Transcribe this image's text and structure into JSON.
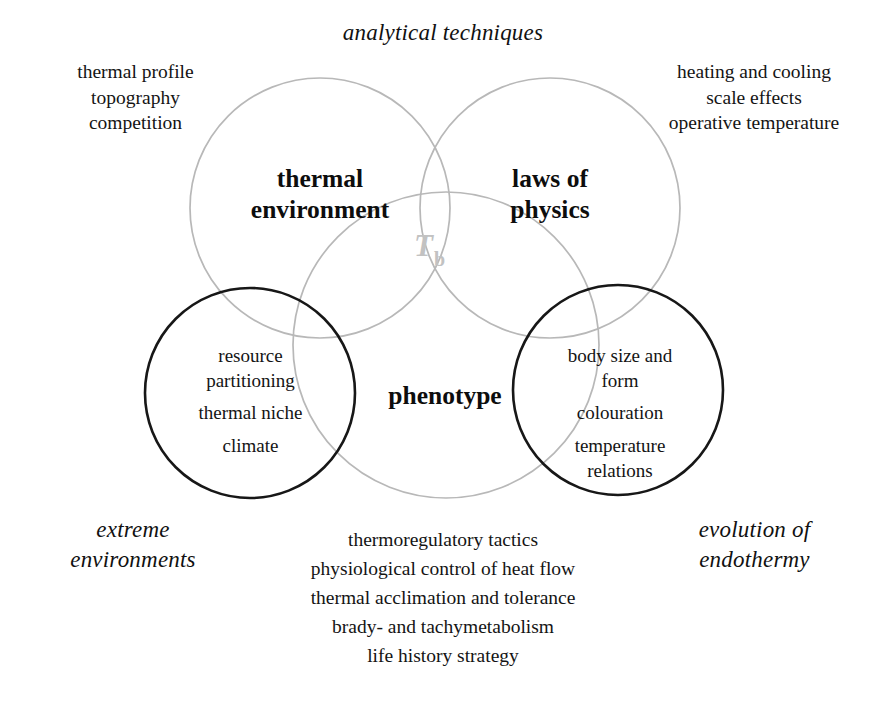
{
  "diagram": {
    "type": "venn",
    "title_caption_top": "analytical techniques",
    "caption_bottom_left_line1": "extreme",
    "caption_bottom_left_line2": "environments",
    "caption_bottom_right_line1": "evolution of",
    "caption_bottom_right_line2": "endothermy",
    "center_symbol_main": "T",
    "center_symbol_sub": "b",
    "colors": {
      "light_circle_stroke": "#b8b8b8",
      "dark_circle_stroke": "#171717",
      "tb_color": "#c2c2c2",
      "text": "#141414",
      "background": "#ffffff"
    },
    "circles": [
      {
        "name": "thermal-environment",
        "title_line1": "thermal",
        "title_line2": "environment",
        "stroke": "light"
      },
      {
        "name": "laws-of-physics",
        "title_line1": "laws of",
        "title_line2": "physics",
        "stroke": "light"
      },
      {
        "name": "phenotype",
        "title_line1": "phenotype",
        "title_line2": "",
        "stroke": "light"
      },
      {
        "name": "extreme-environments",
        "title_line1": "",
        "title_line2": "",
        "stroke": "dark"
      },
      {
        "name": "evolution-of-endothermy",
        "title_line1": "",
        "title_line2": "",
        "stroke": "dark"
      }
    ],
    "satellite_top_left": [
      "thermal profile",
      "topography",
      "competition"
    ],
    "satellite_top_right": [
      "heating and cooling",
      "scale effects",
      "operative temperature"
    ],
    "inner_left": [
      "resource",
      "partitioning",
      "thermal niche",
      "climate"
    ],
    "inner_right": [
      "body size and",
      "form",
      "colouration",
      "temperature",
      "relations"
    ],
    "bottom_list": [
      "thermoregulatory tactics",
      "physiological control of heat flow",
      "thermal acclimation and tolerance",
      "brady- and tachymetabolism",
      "life history strategy"
    ]
  }
}
